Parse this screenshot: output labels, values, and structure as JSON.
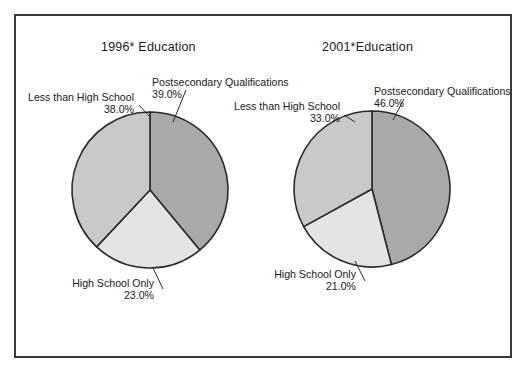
{
  "figure": {
    "border_color": "#3a3a3a",
    "background": "#ffffff"
  },
  "charts": [
    {
      "id": "1996",
      "title": "1996* Education",
      "cx": 150,
      "cy": 190,
      "r": 78,
      "labels": {
        "postsecondary_name": "Postsecondary Qualifications",
        "postsecondary_value": "39.0%",
        "lessthan_name": "Less than High School",
        "lessthan_value": "38.0%",
        "hsonly_name": "High School Only",
        "hsonly_value": "23.0%"
      }
    },
    {
      "id": "2001",
      "title": "2001*Education",
      "cx": 372,
      "cy": 189,
      "r": 78,
      "labels": {
        "postsecondary_name": "Postsecondary Qualifications",
        "postsecondary_value": "46.0%",
        "lessthan_name": "Less than High School",
        "lessthan_value": "33.0%",
        "hsonly_name": "High School Only",
        "hsonly_value": "21.0%"
      }
    }
  ],
  "colors": {
    "postsecondary": "#a9a9a9",
    "less_than_high_school": "#c9c9c9",
    "high_school_only": "#e4e4e4",
    "slice_outline": "#2b2b2b",
    "leader_line": "#2b2b2b",
    "text": "#1a1a1a"
  },
  "chart_data": [
    {
      "type": "pie",
      "title": "1996* Education",
      "categories": [
        "Postsecondary Qualifications",
        "High School Only",
        "Less than High School"
      ],
      "values": [
        39.0,
        23.0,
        38.0
      ],
      "labels": [
        "39.0%",
        "23.0%",
        "38.0%"
      ],
      "colors": [
        "#a9a9a9",
        "#e4e4e4",
        "#c9c9c9"
      ],
      "start_angle": 0,
      "direction": "clockwise",
      "units": "percent",
      "legend": "none",
      "grid": false
    },
    {
      "type": "pie",
      "title": "2001*Education",
      "categories": [
        "Postsecondary Qualifications",
        "High School Only",
        "Less than High School"
      ],
      "values": [
        46.0,
        21.0,
        33.0
      ],
      "labels": [
        "46.0%",
        "21.0%",
        "33.0%"
      ],
      "colors": [
        "#a9a9a9",
        "#e4e4e4",
        "#c9c9c9"
      ],
      "start_angle": 0,
      "direction": "clockwise",
      "units": "percent",
      "legend": "none",
      "grid": false
    }
  ]
}
